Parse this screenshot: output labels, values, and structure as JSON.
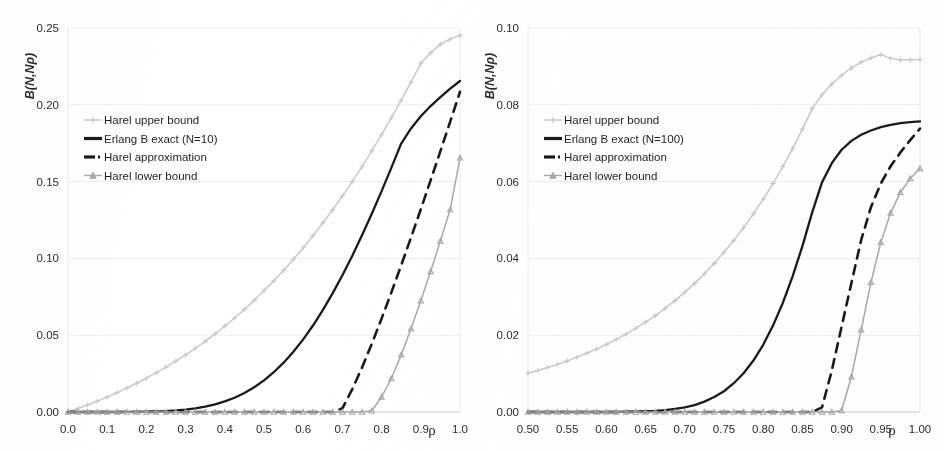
{
  "figure": {
    "background_color": "#ffffff",
    "panel_count": 2
  },
  "style": {
    "upper_bound_color": "#c9c9c9",
    "exact_color": "#1a1a1a",
    "approximation_color": "#1a1a1a",
    "lower_bound_color": "#a8a8a8",
    "gridline_color": "#ededed",
    "axis_text_color": "#2b2b2b"
  },
  "chart_data": [
    {
      "type": "line",
      "panel": "left",
      "title": "",
      "xlabel": "ρ",
      "ylabel": "B(N,Nρ)",
      "xlim": [
        0.0,
        1.0
      ],
      "ylim": [
        0.0,
        0.25
      ],
      "grid": true,
      "legend_position": "upper-left",
      "xticks": [
        "0.0",
        "0.1",
        "0.2",
        "0.3",
        "0.4",
        "0.5",
        "0.6",
        "0.7",
        "0.8",
        "0.9",
        "1.0"
      ],
      "xtick_values": [
        0.0,
        0.1,
        0.2,
        0.3,
        0.4,
        0.5,
        0.6,
        0.7,
        0.8,
        0.9,
        1.0
      ],
      "yticks": [
        "0.00",
        "0.05",
        "0.10",
        "0.15",
        "0.20",
        "0.25"
      ],
      "ytick_values": [
        0.0,
        0.05,
        0.1,
        0.15,
        0.2,
        0.25
      ],
      "x": [
        0.0,
        0.025,
        0.05,
        0.075,
        0.1,
        0.125,
        0.15,
        0.175,
        0.2,
        0.225,
        0.25,
        0.275,
        0.3,
        0.325,
        0.35,
        0.375,
        0.4,
        0.425,
        0.45,
        0.475,
        0.5,
        0.525,
        0.55,
        0.575,
        0.6,
        0.625,
        0.65,
        0.675,
        0.7,
        0.725,
        0.75,
        0.775,
        0.8,
        0.825,
        0.85,
        0.875,
        0.9,
        0.925,
        0.95,
        0.975,
        1.0
      ],
      "series": [
        {
          "name": "Harel upper bound",
          "marker": "plus",
          "linestyle": "solid",
          "color": "#c9c9c9",
          "values": [
            0.0,
            0.0022,
            0.0046,
            0.0071,
            0.0098,
            0.0126,
            0.0156,
            0.0187,
            0.022,
            0.0255,
            0.0292,
            0.0331,
            0.0372,
            0.0415,
            0.046,
            0.0508,
            0.0559,
            0.0612,
            0.0668,
            0.0727,
            0.0789,
            0.0854,
            0.0922,
            0.0994,
            0.1069,
            0.1148,
            0.123,
            0.1316,
            0.1406,
            0.15,
            0.1598,
            0.17,
            0.1806,
            0.1916,
            0.203,
            0.2148,
            0.227,
            0.2338,
            0.2394,
            0.2428,
            0.2452
          ]
        },
        {
          "name": "Erlang B exact (N=10)",
          "marker": "none",
          "linestyle": "solid",
          "color": "#1a1a1a",
          "values": [
            0.0,
            0.0,
            0.0,
            0.0,
            0.0,
            0.0,
            0.0001,
            0.0001,
            0.0002,
            0.0004,
            0.0006,
            0.001,
            0.0016,
            0.0024,
            0.0035,
            0.005,
            0.0069,
            0.0093,
            0.0124,
            0.0161,
            0.0206,
            0.0259,
            0.0321,
            0.0392,
            0.0473,
            0.0563,
            0.0663,
            0.0772,
            0.089,
            0.1016,
            0.115,
            0.1291,
            0.1438,
            0.1591,
            0.1748,
            0.1846,
            0.1925,
            0.1992,
            0.205,
            0.2105,
            0.2155
          ]
        },
        {
          "name": "Harel approximation",
          "marker": "none",
          "linestyle": "dashed",
          "color": "#1a1a1a",
          "values": [
            0.0,
            0.0,
            0.0,
            0.0,
            0.0,
            0.0,
            0.0,
            0.0,
            0.0,
            0.0,
            0.0,
            0.0,
            0.0,
            0.0,
            0.0,
            0.0,
            0.0,
            0.0,
            0.0,
            0.0,
            0.0,
            0.0,
            0.0,
            0.0,
            0.0,
            0.0,
            0.0,
            0.0,
            0.0024,
            0.0148,
            0.0289,
            0.0444,
            0.0608,
            0.0779,
            0.0955,
            0.1136,
            0.132,
            0.1508,
            0.1698,
            0.189,
            0.2085
          ]
        },
        {
          "name": "Harel lower bound",
          "marker": "triangle",
          "linestyle": "solid",
          "color": "#a8a8a8",
          "values": [
            0.0,
            0.0,
            0.0,
            0.0,
            0.0,
            0.0,
            0.0,
            0.0,
            0.0,
            0.0,
            0.0,
            0.0,
            0.0,
            0.0,
            0.0,
            0.0,
            0.0,
            0.0,
            0.0,
            0.0,
            0.0,
            0.0,
            0.0,
            0.0,
            0.0,
            0.0,
            0.0,
            0.0,
            0.0,
            0.0,
            0.0,
            0.0008,
            0.0098,
            0.0218,
            0.0372,
            0.0542,
            0.0724,
            0.0915,
            0.1113,
            0.1318,
            0.1655
          ]
        }
      ]
    },
    {
      "type": "line",
      "panel": "right",
      "title": "",
      "xlabel": "ρ",
      "ylabel": "B(N,Nρ)",
      "xlim": [
        0.5,
        1.0
      ],
      "ylim": [
        0.0,
        0.1
      ],
      "grid": true,
      "legend_position": "upper-left",
      "xticks": [
        "0.50",
        "0.55",
        "0.60",
        "0.65",
        "0.70",
        "0.75",
        "0.80",
        "0.85",
        "0.90",
        "0.95",
        "1.00"
      ],
      "xtick_values": [
        0.5,
        0.55,
        0.6,
        0.65,
        0.7,
        0.75,
        0.8,
        0.85,
        0.9,
        0.95,
        1.0
      ],
      "yticks": [
        "0.00",
        "0.02",
        "0.04",
        "0.06",
        "0.08",
        "0.10"
      ],
      "ytick_values": [
        0.0,
        0.02,
        0.04,
        0.06,
        0.08,
        0.1
      ],
      "x": [
        0.5,
        0.5125,
        0.525,
        0.5375,
        0.55,
        0.5625,
        0.575,
        0.5875,
        0.6,
        0.6125,
        0.625,
        0.6375,
        0.65,
        0.6625,
        0.675,
        0.6875,
        0.7,
        0.7125,
        0.725,
        0.7375,
        0.75,
        0.7625,
        0.775,
        0.7875,
        0.8,
        0.8125,
        0.825,
        0.8375,
        0.85,
        0.8625,
        0.875,
        0.8875,
        0.9,
        0.9125,
        0.925,
        0.9375,
        0.95,
        0.9625,
        0.975,
        0.9875,
        1.0
      ],
      "series": [
        {
          "name": "Harel upper bound",
          "marker": "plus",
          "linestyle": "solid",
          "color": "#c9c9c9",
          "values": [
            0.0101,
            0.0108,
            0.0116,
            0.0124,
            0.0133,
            0.0143,
            0.0153,
            0.0164,
            0.0176,
            0.0189,
            0.0203,
            0.0218,
            0.0234,
            0.0251,
            0.027,
            0.029,
            0.0312,
            0.0335,
            0.036,
            0.0387,
            0.0416,
            0.0447,
            0.048,
            0.0516,
            0.0554,
            0.0595,
            0.0639,
            0.0686,
            0.0736,
            0.079,
            0.0826,
            0.0854,
            0.0877,
            0.0896,
            0.0911,
            0.0922,
            0.0931,
            0.0921,
            0.0917,
            0.0917,
            0.0918
          ]
        },
        {
          "name": "Erlang B exact (N=100)",
          "marker": "none",
          "linestyle": "solid",
          "color": "#1a1a1a",
          "values": [
            0.0,
            0.0,
            0.0,
            0.0,
            0.0,
            0.0,
            0.0,
            0.0,
            0.0,
            0.0,
            0.0001,
            0.0001,
            0.0002,
            0.0003,
            0.0005,
            0.0008,
            0.0012,
            0.0018,
            0.0027,
            0.0039,
            0.0054,
            0.0075,
            0.0101,
            0.0134,
            0.0175,
            0.0225,
            0.0284,
            0.0353,
            0.0432,
            0.052,
            0.0598,
            0.0648,
            0.0683,
            0.0706,
            0.0722,
            0.0733,
            0.0742,
            0.0748,
            0.0752,
            0.0755,
            0.0757
          ]
        },
        {
          "name": "Harel approximation",
          "marker": "none",
          "linestyle": "dashed",
          "color": "#1a1a1a",
          "values": [
            0.0,
            0.0,
            0.0,
            0.0,
            0.0,
            0.0,
            0.0,
            0.0,
            0.0,
            0.0,
            0.0,
            0.0,
            0.0,
            0.0,
            0.0,
            0.0,
            0.0,
            0.0,
            0.0,
            0.0,
            0.0,
            0.0,
            0.0,
            0.0,
            0.0,
            0.0,
            0.0,
            0.0,
            0.0,
            0.0,
            0.0012,
            0.0108,
            0.0222,
            0.0336,
            0.0448,
            0.0534,
            0.0595,
            0.064,
            0.0676,
            0.0708,
            0.0738
          ]
        },
        {
          "name": "Harel lower bound",
          "marker": "triangle",
          "linestyle": "solid",
          "color": "#a8a8a8",
          "values": [
            0.0,
            0.0,
            0.0,
            0.0,
            0.0,
            0.0,
            0.0,
            0.0,
            0.0,
            0.0,
            0.0,
            0.0,
            0.0,
            0.0,
            0.0,
            0.0,
            0.0,
            0.0,
            0.0,
            0.0,
            0.0,
            0.0,
            0.0,
            0.0,
            0.0,
            0.0,
            0.0,
            0.0,
            0.0,
            0.0,
            0.0,
            0.0,
            0.0004,
            0.0092,
            0.0214,
            0.0338,
            0.0442,
            0.0518,
            0.0572,
            0.0608,
            0.0634
          ]
        }
      ]
    }
  ]
}
